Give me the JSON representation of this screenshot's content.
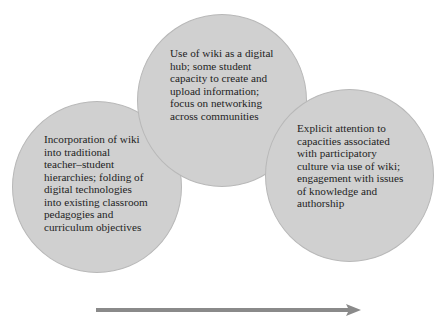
{
  "diagram": {
    "type": "overlapping-circles-progression",
    "circles": [
      {
        "id": "left",
        "lines": [
          "Incorporation of wiki",
          "into traditional",
          "teacher–student",
          "hierarchies; folding of",
          "digital technologies",
          "into existing classroom",
          "pedagogies and",
          "curriculum objectives"
        ],
        "text": "Incorporation of wiki into traditional teacher–student hierarchies; folding of digital technologies into existing classroom pedagogies and curriculum objectives"
      },
      {
        "id": "middle",
        "lines": [
          "Use of wiki as a digital",
          "hub; some student",
          "capacity to create and",
          "upload information;",
          "focus on networking",
          "across communities"
        ],
        "text": "Use of wiki as a digital hub; some student capacity to create and upload information; focus on networking across communities"
      },
      {
        "id": "right",
        "lines": [
          "Explicit attention to",
          "capacities associated",
          "with participatory",
          "culture via use of wiki;",
          "engagement with issues",
          "of knowledge and",
          "authorship"
        ],
        "text": "Explicit attention to capacities associated with participatory culture via use of wiki; engagement with issues of knowledge and authorship"
      }
    ],
    "arrow": {
      "direction": "right",
      "meaning": "progression"
    },
    "colors": {
      "circle_fill": "#d0d0d0",
      "circle_border": "#b8b8b8",
      "arrow": "#8a8a8a",
      "text": "#1e1e1e",
      "background": "#ffffff"
    }
  }
}
